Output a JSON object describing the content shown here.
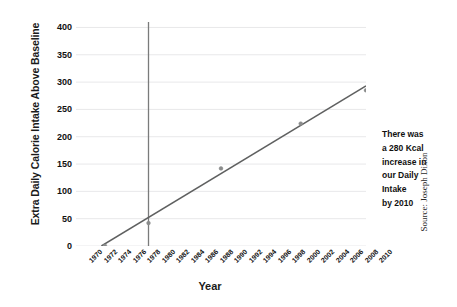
{
  "chart_data": {
    "type": "scatter",
    "title": "",
    "xlabel": "Year",
    "ylabel": "Extra Daily Calorie Intake Above Baseline",
    "xlim": [
      1970,
      2010
    ],
    "ylim": [
      0,
      410
    ],
    "yticks": [
      0,
      50,
      100,
      150,
      200,
      250,
      300,
      350,
      400
    ],
    "xticks": [
      1970,
      1972,
      1974,
      1976,
      1978,
      1980,
      1982,
      1984,
      1986,
      1988,
      1990,
      1992,
      1994,
      1996,
      1998,
      2000,
      2002,
      2004,
      2006,
      2008,
      2010
    ],
    "grid": "horizontal",
    "legend": "none",
    "series": [
      {
        "name": "Extra daily calorie intake",
        "type": "scatter",
        "points": [
          {
            "x": 1974,
            "y": 0
          },
          {
            "x": 1980,
            "y": 42
          },
          {
            "x": 1990,
            "y": 142
          },
          {
            "x": 2001,
            "y": 224
          },
          {
            "x": 2010,
            "y": 285
          }
        ]
      },
      {
        "name": "Trend line",
        "type": "line",
        "points": [
          {
            "x": 1973.5,
            "y": 0
          },
          {
            "x": 2010,
            "y": 293
          }
        ]
      }
    ],
    "markers": [
      {
        "name": "1980 reference line",
        "type": "vline",
        "x": 1980,
        "y_from": 0,
        "y_to": 410
      },
      {
        "name": "2010 range bracket",
        "type": "bracket",
        "x": 2010,
        "y_from": 0,
        "y_to": 290
      }
    ],
    "annotations": [
      {
        "name": "280-kcal-callout",
        "lines": [
          "There was",
          "a 280 Kcal",
          "increase in",
          "our Daily",
          "Intake",
          "by 2010"
        ]
      }
    ],
    "colors": {
      "line": "#5f6060",
      "marker": "#8b8c8c",
      "gridline": "#e8e8ea",
      "reference_line": "#7a7b7b",
      "bracket": "#6e6f6f",
      "text": "#111111",
      "background": "#ffffff"
    }
  },
  "axes": {
    "y_title": "Extra Daily Calorie Intake Above Baseline",
    "x_title": "Year",
    "y_tick_labels": [
      "0",
      "50",
      "100",
      "150",
      "200",
      "250",
      "300",
      "350",
      "400"
    ],
    "x_tick_labels": [
      "1970",
      "1972",
      "1974",
      "1976",
      "1978",
      "1980",
      "1982",
      "1984",
      "1986",
      "1988",
      "1990",
      "1992",
      "1994",
      "1996",
      "1998",
      "2000",
      "2002",
      "2004",
      "2006",
      "2008",
      "2010"
    ]
  },
  "annotation": {
    "line1": "There was",
    "line2": "a 280 Kcal",
    "line3": "increase in",
    "line4": "our Daily",
    "line5": "Intake",
    "line6": "by 2010"
  },
  "source": {
    "credit": "Source: Joseph Dixon"
  }
}
